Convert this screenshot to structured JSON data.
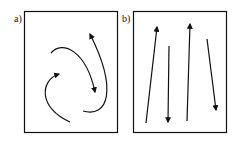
{
  "panels": [
    {
      "label": "a)",
      "description": "curved rotating arrows"
    },
    {
      "label": "b)",
      "description": "straight alternating up/down arrows"
    }
  ],
  "colors": {
    "stroke": "#111111",
    "background": "#ffffff"
  }
}
